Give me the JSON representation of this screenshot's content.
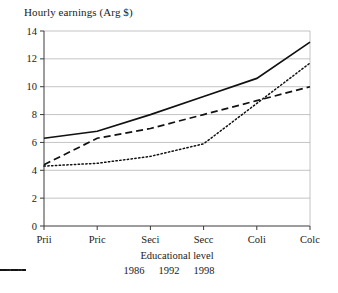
{
  "chart_data": {
    "type": "line",
    "title": "Hourly earnings (Arg $)",
    "xlabel": "Educational level",
    "ylabel": "",
    "categories": [
      "Prii",
      "Pric",
      "Seci",
      "Secc",
      "Coli",
      "Colc"
    ],
    "x_tick_labels": [
      "Prii",
      "Pric",
      "Seci",
      "Secc",
      "Coli",
      "Colc"
    ],
    "y_tick_labels": [
      "0",
      "2",
      "4",
      "6",
      "8",
      "10",
      "12",
      "14"
    ],
    "y_ticks": [
      0,
      2,
      4,
      6,
      8,
      10,
      12,
      14
    ],
    "ylim": [
      0,
      14
    ],
    "grid": "horizontal",
    "legend_position": "bottom",
    "series": [
      {
        "name": "1986",
        "style": "solid",
        "values": [
          6.3,
          6.8,
          8.0,
          9.3,
          10.6,
          13.2
        ]
      },
      {
        "name": "1992",
        "style": "dashed",
        "values": [
          4.4,
          6.3,
          7.0,
          8.0,
          9.0,
          10.0
        ]
      },
      {
        "name": "1998",
        "style": "dotted",
        "values": [
          4.3,
          4.5,
          5.0,
          5.9,
          8.8,
          11.7
        ]
      }
    ]
  },
  "legend": {
    "items": [
      {
        "label": "1986",
        "style": "solid"
      },
      {
        "label": "1992",
        "style": "dashed"
      },
      {
        "label": "1998",
        "style": "dotted"
      }
    ]
  },
  "colors": {
    "line": "#111111",
    "grid": "#a9a9a9",
    "axis": "#3a3a3a",
    "text": "#1a1a1a",
    "background": "#ffffff"
  }
}
